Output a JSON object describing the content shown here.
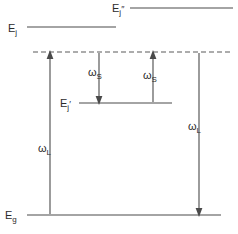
{
  "diagram": {
    "kind": "energy-level-diagram",
    "background_color": "#ffffff",
    "line_color": "#4a4a4a",
    "text_color": "#2b2b2b",
    "levels": [
      {
        "id": "E_j_double_prime",
        "base_label": "E",
        "subscript": "j",
        "prime": "″",
        "style": "solid",
        "label_x": 112,
        "label_y": 12,
        "x1": 130,
        "x2": 233,
        "y": 8
      },
      {
        "id": "E_j",
        "base_label": "E",
        "subscript": "j",
        "prime": "",
        "style": "solid",
        "label_x": 8,
        "label_y": 32,
        "x1": 27,
        "x2": 116,
        "y": 27
      },
      {
        "id": "E_j_prime",
        "base_label": "E",
        "subscript": "j",
        "prime": "′",
        "style": "solid",
        "label_x": 60,
        "label_y": 107,
        "x1": 79,
        "x2": 172,
        "y": 103
      },
      {
        "id": "E_g",
        "base_label": "E",
        "subscript": "g",
        "prime": "",
        "style": "solid",
        "label_x": 5,
        "label_y": 219,
        "x1": 27,
        "x2": 221,
        "y": 215
      }
    ],
    "virtual_levels": [
      {
        "id": "virtual-state-dashed",
        "style": "dashed",
        "x1": 33,
        "x2": 231,
        "y": 52
      }
    ],
    "transitions": [
      {
        "id": "omega-L-left-up",
        "base_label": "ω",
        "subscript": "L",
        "direction": "up",
        "x": 50,
        "y_from": 214,
        "y_to": 53,
        "label_x": 38,
        "label_y": 152
      },
      {
        "id": "omega-S-left-down",
        "base_label": "ω",
        "subscript": "S",
        "direction": "down",
        "x": 99,
        "y_from": 53,
        "y_to": 102,
        "label_x": 88,
        "label_y": 76
      },
      {
        "id": "omega-S-right-up",
        "base_label": "ω",
        "subscript": "S",
        "direction": "up",
        "x": 153,
        "y_from": 102,
        "y_to": 53,
        "label_x": 143,
        "label_y": 79
      },
      {
        "id": "omega-L-right-down",
        "base_label": "ω",
        "subscript": "L",
        "direction": "down",
        "x": 199,
        "y_from": 53,
        "y_to": 214,
        "label_x": 188,
        "label_y": 130
      }
    ]
  }
}
